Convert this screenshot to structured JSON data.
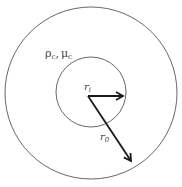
{
  "diagram": {
    "region_label": "ρc, μc",
    "region_label_main1": "ρ",
    "region_label_sub1": "c",
    "region_label_sep": ",",
    "region_label_main2": "μ",
    "region_label_sub2": "c",
    "inner_radius_label": "r",
    "inner_radius_sub": "i",
    "outer_radius_label": "r",
    "outer_radius_sub": "0",
    "colors": {
      "circle_stroke": "#555555",
      "arrow": "#1a1a1a",
      "text": "#444444"
    }
  }
}
